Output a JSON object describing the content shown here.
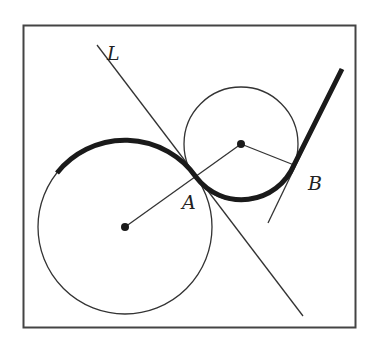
{
  "diagram": {
    "frame": {
      "x": 23,
      "y": 25,
      "width": 333,
      "height": 303
    },
    "labels": {
      "line": "L",
      "point_a": "A",
      "point_b": "B"
    },
    "large_circle": {
      "cx": 125,
      "cy": 227,
      "r": 87
    },
    "small_circle": {
      "cx": 241,
      "cy": 144,
      "r": 57
    },
    "colors": {
      "stroke": "#222222",
      "background": "#ffffff"
    }
  }
}
